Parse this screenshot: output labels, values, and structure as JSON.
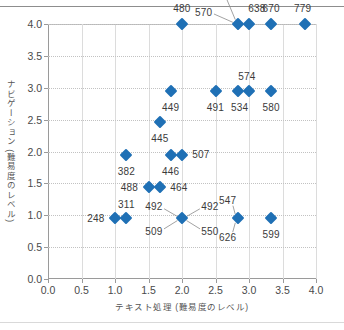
{
  "chart_data": {
    "type": "scatter",
    "title": "",
    "xlabel": "テキスト処理 (難易度のレベル)",
    "ylabel": "ナビゲーション (難易度のレベル)",
    "xlim": [
      0.0,
      4.0
    ],
    "ylim": [
      0.0,
      4.0
    ],
    "xticks": [
      "0.0",
      "0.5",
      "1.0",
      "1.5",
      "2.0",
      "2.5",
      "3.0",
      "3.5",
      "4.0"
    ],
    "yticks": [
      "0.0",
      "0.5",
      "1.0",
      "1.5",
      "2.0",
      "2.5",
      "3.0",
      "3.5",
      "4.0"
    ],
    "xtick_values": [
      0.0,
      0.5,
      1.0,
      1.5,
      2.0,
      2.5,
      3.0,
      3.5,
      4.0
    ],
    "ytick_values": [
      0.0,
      0.5,
      1.0,
      1.5,
      2.0,
      2.5,
      3.0,
      3.5,
      4.0
    ],
    "grid": true,
    "grid_horizontal_style": "dotted",
    "grid_vertical_style": "solid",
    "legend": false,
    "marker_shape": "diamond",
    "marker_color": "#1f70b5",
    "points": [
      {
        "label": "480",
        "x": 2.0,
        "y": 4.0
      },
      {
        "label": "546",
        "x": 2.83,
        "y": 4.0
      },
      {
        "label": "638",
        "x": 3.0,
        "y": 4.0
      },
      {
        "label": "670",
        "x": 3.33,
        "y": 4.0
      },
      {
        "label": "779",
        "x": 3.83,
        "y": 4.0
      },
      {
        "label": "570",
        "x": 2.83,
        "y": 4.0
      },
      {
        "label": "449",
        "x": 1.83,
        "y": 2.95
      },
      {
        "label": "491",
        "x": 2.5,
        "y": 2.95
      },
      {
        "label": "534",
        "x": 2.83,
        "y": 2.95
      },
      {
        "label": "574",
        "x": 3.0,
        "y": 2.95
      },
      {
        "label": "580",
        "x": 3.33,
        "y": 2.95
      },
      {
        "label": "445",
        "x": 1.67,
        "y": 2.47
      },
      {
        "label": "382",
        "x": 1.17,
        "y": 1.95
      },
      {
        "label": "446",
        "x": 1.83,
        "y": 1.95
      },
      {
        "label": "507",
        "x": 2.0,
        "y": 1.95
      },
      {
        "label": "488",
        "x": 1.5,
        "y": 1.45
      },
      {
        "label": "464",
        "x": 1.67,
        "y": 1.45
      },
      {
        "label": "248",
        "x": 1.0,
        "y": 0.95
      },
      {
        "label": "311",
        "x": 1.17,
        "y": 0.95
      },
      {
        "label": "492",
        "x": 2.0,
        "y": 0.95
      },
      {
        "label": "509",
        "x": 2.0,
        "y": 0.95
      },
      {
        "label": "550",
        "x": 2.0,
        "y": 0.95
      },
      {
        "label": "547",
        "x": 2.83,
        "y": 0.95
      },
      {
        "label": "626",
        "x": 2.83,
        "y": 0.95
      },
      {
        "label": "599",
        "x": 3.33,
        "y": 0.95
      }
    ],
    "markers": [
      {
        "x": 2.0,
        "y": 4.0
      },
      {
        "x": 2.83,
        "y": 4.0
      },
      {
        "x": 3.0,
        "y": 4.0
      },
      {
        "x": 3.33,
        "y": 4.0
      },
      {
        "x": 3.83,
        "y": 4.0
      },
      {
        "x": 1.83,
        "y": 2.95
      },
      {
        "x": 2.5,
        "y": 2.95
      },
      {
        "x": 2.83,
        "y": 2.95
      },
      {
        "x": 3.0,
        "y": 2.95
      },
      {
        "x": 3.33,
        "y": 2.95
      },
      {
        "x": 1.67,
        "y": 2.47
      },
      {
        "x": 1.17,
        "y": 1.95
      },
      {
        "x": 1.83,
        "y": 1.95
      },
      {
        "x": 2.0,
        "y": 1.95
      },
      {
        "x": 1.5,
        "y": 1.45
      },
      {
        "x": 1.67,
        "y": 1.45
      },
      {
        "x": 1.0,
        "y": 0.95
      },
      {
        "x": 1.17,
        "y": 0.95
      },
      {
        "x": 2.0,
        "y": 0.95
      },
      {
        "x": 2.83,
        "y": 0.95
      },
      {
        "x": 3.33,
        "y": 0.95
      }
    ],
    "annotations": [
      {
        "text": "480",
        "x": 2.0,
        "y": 4.0,
        "dx": 0,
        "dy": -16,
        "leader": false
      },
      {
        "text": "570",
        "x": 2.83,
        "y": 4.0,
        "dx": -34,
        "dy": -12,
        "leader": true
      },
      {
        "text": "546",
        "x": 2.83,
        "y": 4.0,
        "dx": -16,
        "dy": -30,
        "leader": true
      },
      {
        "text": "638",
        "x": 3.0,
        "y": 4.0,
        "dx": 8,
        "dy": -16,
        "leader": false
      },
      {
        "text": "670",
        "x": 3.33,
        "y": 4.0,
        "dx": 0,
        "dy": -16,
        "leader": false
      },
      {
        "text": "779",
        "x": 3.83,
        "y": 4.0,
        "dx": -2,
        "dy": -16,
        "leader": false
      },
      {
        "text": "449",
        "x": 1.83,
        "y": 2.95,
        "dx": 0,
        "dy": 16,
        "leader": false
      },
      {
        "text": "491",
        "x": 2.5,
        "y": 2.95,
        "dx": 0,
        "dy": 16,
        "leader": false
      },
      {
        "text": "534",
        "x": 2.83,
        "y": 2.95,
        "dx": 2,
        "dy": 16,
        "leader": false
      },
      {
        "text": "574",
        "x": 3.0,
        "y": 2.95,
        "dx": -2,
        "dy": -15,
        "leader": false
      },
      {
        "text": "580",
        "x": 3.33,
        "y": 2.95,
        "dx": 0,
        "dy": 16,
        "leader": false
      },
      {
        "text": "445",
        "x": 1.67,
        "y": 2.47,
        "dx": 0,
        "dy": 16,
        "leader": false
      },
      {
        "text": "382",
        "x": 1.17,
        "y": 1.95,
        "dx": 0,
        "dy": 16,
        "leader": false
      },
      {
        "text": "446",
        "x": 1.83,
        "y": 1.95,
        "dx": 0,
        "dy": 16,
        "leader": false
      },
      {
        "text": "507",
        "x": 2.0,
        "y": 1.95,
        "dx": 19,
        "dy": -1,
        "leader": false
      },
      {
        "text": "488",
        "x": 1.5,
        "y": 1.45,
        "dx": -19,
        "dy": 0,
        "leader": false
      },
      {
        "text": "464",
        "x": 1.67,
        "y": 1.45,
        "dx": 19,
        "dy": 0,
        "leader": false
      },
      {
        "text": "248",
        "x": 1.0,
        "y": 0.95,
        "dx": -19,
        "dy": 0,
        "leader": false
      },
      {
        "text": "311",
        "x": 1.17,
        "y": 0.95,
        "dx": 0,
        "dy": -14,
        "leader": false
      },
      {
        "text": "492",
        "x": 2.0,
        "y": 0.95,
        "dx": -28,
        "dy": -12,
        "leader": true
      },
      {
        "text": "492",
        "x": 2.0,
        "y": 0.95,
        "dx": 28,
        "dy": -12,
        "leader": true
      },
      {
        "text": "509",
        "x": 2.0,
        "y": 0.95,
        "dx": -28,
        "dy": 13,
        "leader": true
      },
      {
        "text": "550",
        "x": 2.0,
        "y": 0.95,
        "dx": 28,
        "dy": 13,
        "leader": true
      },
      {
        "text": "547",
        "x": 2.83,
        "y": 0.95,
        "dx": -10,
        "dy": -18,
        "leader": true
      },
      {
        "text": "626",
        "x": 2.83,
        "y": 0.95,
        "dx": -10,
        "dy": 19,
        "leader": true
      },
      {
        "text": "599",
        "x": 3.33,
        "y": 0.95,
        "dx": 0,
        "dy": 16,
        "leader": false
      }
    ]
  }
}
